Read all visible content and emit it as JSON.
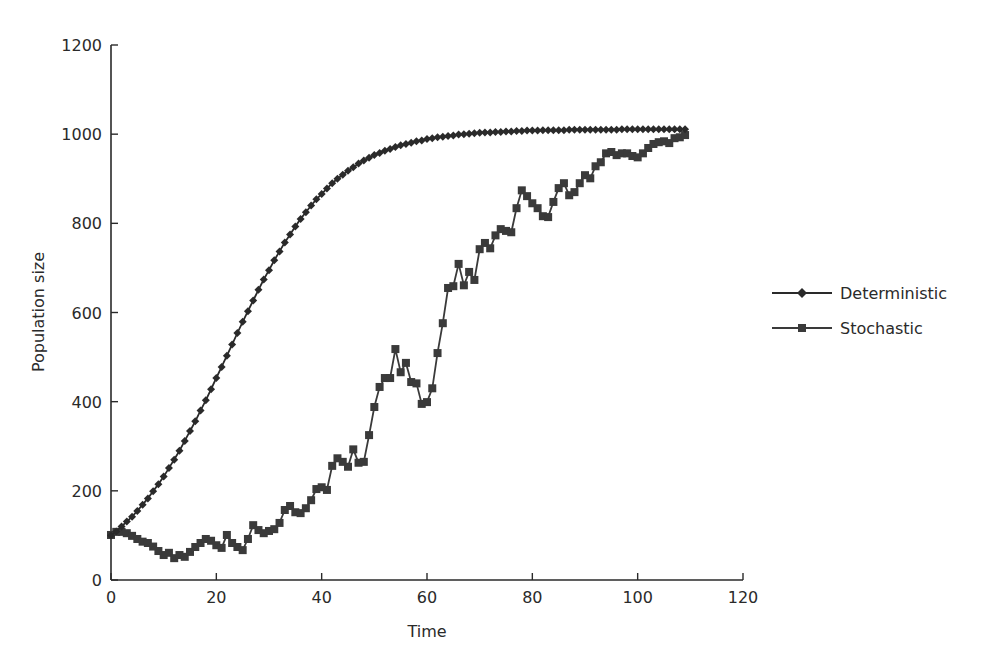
{
  "chart_data": {
    "type": "line",
    "title": "",
    "xlabel": "Time",
    "ylabel": "Population size",
    "xlim": [
      0,
      120
    ],
    "ylim": [
      0,
      1200
    ],
    "xticks": [
      0,
      20,
      40,
      60,
      80,
      100,
      120
    ],
    "yticks": [
      0,
      200,
      400,
      600,
      800,
      1000,
      1200
    ],
    "grid": false,
    "legend_position": "right",
    "x": [
      0,
      1,
      2,
      3,
      4,
      5,
      6,
      7,
      8,
      9,
      10,
      11,
      12,
      13,
      14,
      15,
      16,
      17,
      18,
      19,
      20,
      21,
      22,
      23,
      24,
      25,
      26,
      27,
      28,
      29,
      30,
      31,
      32,
      33,
      34,
      35,
      36,
      37,
      38,
      39,
      40,
      41,
      42,
      43,
      44,
      45,
      46,
      47,
      48,
      49,
      50,
      51,
      52,
      53,
      54,
      55,
      56,
      57,
      58,
      59,
      60,
      61,
      62,
      63,
      64,
      65,
      66,
      67,
      68,
      69,
      70,
      71,
      72,
      73,
      74,
      75,
      76,
      77,
      78,
      79,
      80,
      81,
      82,
      83,
      84,
      85,
      86,
      87,
      88,
      89,
      90,
      91,
      92,
      93,
      94,
      95,
      96,
      97,
      98,
      99,
      100,
      101,
      102,
      103,
      104,
      105,
      106,
      107,
      108,
      109
    ],
    "series": [
      {
        "name": "Deterministic",
        "marker": "diamond",
        "color": "#2a2a2a",
        "values": [
          100,
          109,
          120,
          131,
          142,
          155,
          169,
          183,
          199,
          215,
          232,
          251,
          270,
          290,
          312,
          334,
          356,
          380,
          403,
          428,
          453,
          478,
          503,
          528,
          554,
          579,
          603,
          627,
          651,
          674,
          695,
          717,
          737,
          757,
          775,
          793,
          810,
          825,
          840,
          854,
          866,
          878,
          890,
          900,
          909,
          918,
          926,
          934,
          941,
          947,
          953,
          958,
          963,
          967,
          971,
          975,
          978,
          981,
          984,
          986,
          989,
          991,
          993,
          994,
          996,
          997,
          999,
          1000,
          1001,
          1002,
          1003,
          1004,
          1004,
          1005,
          1005,
          1006,
          1006,
          1007,
          1007,
          1008,
          1008,
          1008,
          1009,
          1009,
          1009,
          1009,
          1009,
          1010,
          1010,
          1010,
          1010,
          1010,
          1010,
          1010,
          1010,
          1010,
          1010,
          1011,
          1011,
          1011,
          1011,
          1011,
          1011,
          1011,
          1011,
          1011,
          1011,
          1011,
          1011,
          1011
        ]
      },
      {
        "name": "Stochastic",
        "marker": "square",
        "color": "#3a3a3a",
        "values": [
          101,
          108,
          108,
          105,
          99,
          92,
          86,
          83,
          75,
          65,
          56,
          61,
          49,
          56,
          52,
          63,
          74,
          83,
          92,
          88,
          78,
          72,
          101,
          83,
          74,
          67,
          92,
          123,
          112,
          105,
          110,
          114,
          128,
          157,
          166,
          152,
          150,
          161,
          179,
          204,
          208,
          202,
          256,
          273,
          265,
          254,
          293,
          263,
          265,
          325,
          388,
          433,
          453,
          453,
          518,
          466,
          487,
          444,
          441,
          395,
          399,
          430,
          509,
          576,
          655,
          659,
          709,
          661,
          691,
          673,
          742,
          756,
          744,
          773,
          787,
          783,
          780,
          834,
          874,
          861,
          845,
          834,
          816,
          814,
          848,
          879,
          890,
          863,
          870,
          890,
          908,
          901,
          928,
          937,
          957,
          960,
          953,
          957,
          957,
          951,
          948,
          957,
          969,
          978,
          982,
          984,
          980,
          991,
          993,
          998
        ]
      }
    ]
  },
  "axes": {
    "x_title": "Time",
    "y_title": "Population size",
    "x_tick_labels": [
      "0",
      "20",
      "40",
      "60",
      "80",
      "100",
      "120"
    ],
    "y_tick_labels": [
      "0",
      "200",
      "400",
      "600",
      "800",
      "1000",
      "1200"
    ]
  },
  "legend": {
    "items": [
      {
        "label": "Deterministic",
        "marker": "diamond"
      },
      {
        "label": "Stochastic",
        "marker": "square"
      }
    ]
  }
}
